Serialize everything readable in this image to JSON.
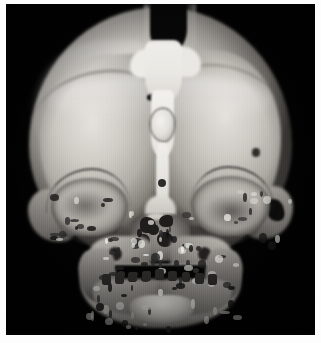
{
  "image": {
    "kind": "medical-3d-volume-rendering",
    "modality": "CT",
    "view": "anterior (frontal) view",
    "subject": "infant skull",
    "colormap": "grayscale",
    "background_color": "#000000",
    "border_color": "#fdfdfd",
    "has_visible_text": false,
    "caption": "",
    "annotations": []
  },
  "frame": {
    "width_px": 321,
    "height_px": 343,
    "border_top_px": 4,
    "border_right_px": 6,
    "border_bottom_px": 8,
    "border_left_px": 6
  },
  "anatomy": {
    "structures": [
      {
        "name": "calvarium",
        "label": "Cranial vault"
      },
      {
        "name": "frontal-bone-left",
        "label": "Left frontal bone"
      },
      {
        "name": "frontal-bone-right",
        "label": "Right frontal bone"
      },
      {
        "name": "metopic-suture",
        "label": "Metopic suture"
      },
      {
        "name": "anterior-fontanelle",
        "label": "Anterior fontanelle"
      },
      {
        "name": "coronal-suture-left",
        "label": "Left coronal suture"
      },
      {
        "name": "coronal-suture-right",
        "label": "Right coronal suture"
      },
      {
        "name": "wormian-bone",
        "label": "Sutural (wormian) bone island"
      },
      {
        "name": "orbit-left",
        "label": "Left orbit"
      },
      {
        "name": "orbit-right",
        "label": "Right orbit"
      },
      {
        "name": "supraorbital-ridge",
        "label": "Supraorbital ridge"
      },
      {
        "name": "zygoma-left",
        "label": "Left zygoma"
      },
      {
        "name": "zygoma-right",
        "label": "Right zygoma"
      },
      {
        "name": "nasal-cavity",
        "label": "Nasal cavity and turbinates"
      },
      {
        "name": "maxilla",
        "label": "Maxilla"
      },
      {
        "name": "alveolar-ridge",
        "label": "Alveolar ridge"
      },
      {
        "name": "mandible",
        "label": "Mandible"
      },
      {
        "name": "mental-symphysis",
        "label": "Mental symphysis (chin)"
      },
      {
        "name": "oral-cavity",
        "label": "Open oral cavity"
      }
    ]
  },
  "grayscale": {
    "background": "#000000",
    "bone_highlight": "#f4f3ef",
    "bone_midtone": "#b3b0aa",
    "bone_shadow": "#4f4c48",
    "suture_dark": "#0a0a0a"
  }
}
